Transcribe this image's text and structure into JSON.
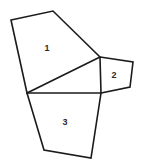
{
  "figure": {
    "type": "geometry-line-drawing",
    "canvas": {
      "width": 142,
      "height": 166
    },
    "colors": {
      "background": "#ffffff",
      "stroke": "#1b1b1b",
      "label": "#2a2a2a"
    },
    "stroke_width": 1.6,
    "regions": [
      {
        "id": "region-1",
        "label": "1",
        "shape": "quadrilateral",
        "label_position": {
          "x": 47,
          "y": 48
        },
        "vertices": [
          {
            "x": 11,
            "y": 20
          },
          {
            "x": 53,
            "y": 11
          },
          {
            "x": 100,
            "y": 57
          },
          {
            "x": 27,
            "y": 93
          }
        ],
        "points": "11,20 53,11 100,57 27,93"
      },
      {
        "id": "region-2",
        "label": "2",
        "shape": "quadrilateral",
        "label_position": {
          "x": 114,
          "y": 75
        },
        "vertices": [
          {
            "x": 100,
            "y": 57
          },
          {
            "x": 133,
            "y": 62
          },
          {
            "x": 130,
            "y": 87
          },
          {
            "x": 101,
            "y": 93
          }
        ],
        "points": "100,57 133,62 130,87 101,93"
      },
      {
        "id": "region-3",
        "label": "3",
        "shape": "quadrilateral",
        "label_position": {
          "x": 65,
          "y": 122
        },
        "vertices": [
          {
            "x": 27,
            "y": 93
          },
          {
            "x": 101,
            "y": 93
          },
          {
            "x": 91,
            "y": 158
          },
          {
            "x": 44,
            "y": 150
          }
        ],
        "points": "27,93 101,93 91,158 44,150"
      }
    ]
  }
}
